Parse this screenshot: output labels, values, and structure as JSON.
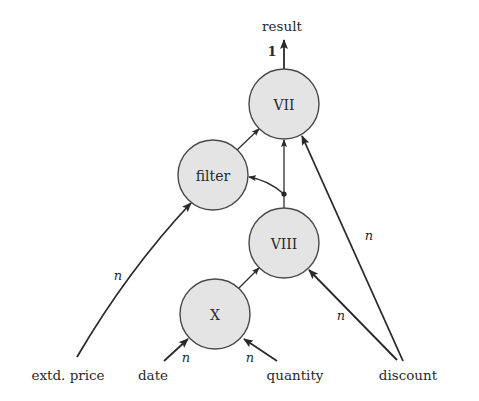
{
  "diagram": {
    "output_label": "result",
    "output_multiplicity": "1",
    "nodes": {
      "vii": {
        "label": "VII",
        "cx": 284,
        "cy": 104,
        "r": 35
      },
      "filter": {
        "label": "filter",
        "cx": 213,
        "cy": 175,
        "r": 35
      },
      "viii": {
        "label": "VIII",
        "cx": 284,
        "cy": 243,
        "r": 35
      },
      "x": {
        "label": "X",
        "cx": 215,
        "cy": 314,
        "r": 35
      }
    },
    "inputs": {
      "extd_price": "extd. price",
      "date": "date",
      "quantity": "quantity",
      "discount": "discount"
    },
    "multiplicities": {
      "extd_price_to_filter": "n",
      "date_to_x": "n",
      "quantity_to_x": "n",
      "discount_to_viii": "n",
      "discount_to_vii": "n"
    },
    "colors": {
      "node_fill": "#e4e4e4",
      "node_stroke": "#4a4a4a",
      "edge": "#2e2e2e",
      "background": "#ffffff"
    }
  }
}
